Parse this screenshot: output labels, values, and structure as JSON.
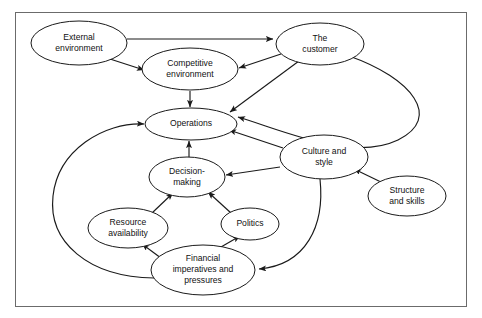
{
  "figure": {
    "type": "node-link-diagram",
    "frame": {
      "visible": true,
      "border_color": "#6b6b6b",
      "background": "#ffffff"
    },
    "stroke_color": "#1a1a1a",
    "node_fill": "#ffffff"
  },
  "nodes": [
    {
      "id": "external-environment",
      "label_lines": [
        "External",
        "environment"
      ],
      "label": "External environment",
      "cx": 79,
      "cy": 43,
      "rx": 48,
      "ry": 22
    },
    {
      "id": "competitive-environment",
      "label_lines": [
        "Competitive",
        "environment"
      ],
      "label": "Competitive environment",
      "cx": 190,
      "cy": 69,
      "rx": 48,
      "ry": 21
    },
    {
      "id": "the-customer",
      "label_lines": [
        "The",
        "customer"
      ],
      "label": "The customer",
      "cx": 320,
      "cy": 44,
      "rx": 44,
      "ry": 21
    },
    {
      "id": "operations",
      "label_lines": [
        "Operations"
      ],
      "label": "Operations",
      "cx": 191,
      "cy": 124,
      "rx": 46,
      "ry": 16
    },
    {
      "id": "decision-making",
      "label_lines": [
        "Decision-",
        "making"
      ],
      "label": "Decision-making",
      "cx": 187,
      "cy": 177,
      "rx": 38,
      "ry": 20
    },
    {
      "id": "culture-and-style",
      "label_lines": [
        "Culture and",
        "style"
      ],
      "label": "Culture and style",
      "cx": 324,
      "cy": 157,
      "rx": 44,
      "ry": 22
    },
    {
      "id": "structure-and-skills",
      "label_lines": [
        "Structure",
        "and skills"
      ],
      "label": "Structure and skills",
      "cx": 407,
      "cy": 196,
      "rx": 39,
      "ry": 20
    },
    {
      "id": "resource-availability",
      "label_lines": [
        "Resource",
        "availability"
      ],
      "label": "Resource availability",
      "cx": 128,
      "cy": 228,
      "rx": 40,
      "ry": 20
    },
    {
      "id": "politics",
      "label_lines": [
        "Politics"
      ],
      "label": "Politics",
      "cx": 250,
      "cy": 224,
      "rx": 29,
      "ry": 16
    },
    {
      "id": "financial-imperatives",
      "label_lines": [
        "Financial",
        "imperatives and",
        "pressures"
      ],
      "label": "Financial imperatives and pressures",
      "cx": 203,
      "cy": 270,
      "rx": 52,
      "ry": 25
    }
  ],
  "edges": [
    {
      "id": "external-to-customer",
      "from": "external-environment",
      "to": "the-customer",
      "style": "straight",
      "d": "M 127 39 L 273 39",
      "arrow": true
    },
    {
      "id": "external-to-competitive",
      "from": "external-environment",
      "to": "competitive-environment",
      "style": "straight",
      "d": "M 110 59 L 144 70",
      "arrow": true
    },
    {
      "id": "customer-to-competitive",
      "from": "the-customer",
      "to": "competitive-environment",
      "style": "straight",
      "d": "M 281 54 L 239 68",
      "arrow": true
    },
    {
      "id": "competitive-to-operations",
      "from": "competitive-environment",
      "to": "operations",
      "style": "straight",
      "d": "M 190 91 L 190 107",
      "arrow": true
    },
    {
      "id": "customer-to-operations",
      "from": "the-customer",
      "to": "operations",
      "style": "straight",
      "d": "M 299 61 L 230 112",
      "arrow": true
    },
    {
      "id": "culture-to-operations",
      "from": "culture-and-style",
      "to": "operations",
      "style": "straight",
      "d": "M 283 148 L 229 130",
      "arrow": true
    },
    {
      "id": "decision-to-operations",
      "from": "decision-making",
      "to": "operations",
      "style": "straight",
      "d": "M 189 157 L 189 141",
      "arrow": true
    },
    {
      "id": "customer-arc-to-operations",
      "from": "the-customer",
      "to": "operations",
      "style": "arc-right",
      "d": "M 349 56 C 412 78 443 118 398 140 C 352 162 285 131 238 117",
      "arrow": true
    },
    {
      "id": "resource-to-decision",
      "from": "resource-availability",
      "to": "decision-making",
      "style": "straight",
      "d": "M 152 213 L 173 193",
      "arrow": true
    },
    {
      "id": "politics-to-decision",
      "from": "politics",
      "to": "decision-making",
      "style": "straight",
      "d": "M 231 213 L 208 192",
      "arrow": true
    },
    {
      "id": "culture-to-decision",
      "from": "culture-and-style",
      "to": "decision-making",
      "style": "straight",
      "d": "M 280 167 L 226 175",
      "arrow": true
    },
    {
      "id": "financial-to-resource",
      "from": "financial-imperatives",
      "to": "resource-availability",
      "style": "straight",
      "d": "M 165 261 L 142 244",
      "arrow": true
    },
    {
      "id": "financial-to-politics",
      "from": "financial-imperatives",
      "to": "politics",
      "style": "straight",
      "d": "M 221 247 L 240 236",
      "arrow": true
    },
    {
      "id": "structure-to-culture",
      "from": "structure-and-skills",
      "to": "culture-and-style",
      "style": "straight",
      "d": "M 383 183 L 354 169",
      "arrow": true
    },
    {
      "id": "culture-to-financial",
      "from": "culture-and-style",
      "to": "financial-imperatives",
      "style": "arc-down",
      "d": "M 320 179 C 325 226 306 265 259 269",
      "arrow": true
    },
    {
      "id": "financial-arc-to-operations",
      "from": "financial-imperatives",
      "to": "operations",
      "style": "arc-left",
      "d": "M 154 278 C 88 277 48 242 53 196 C 58 150 104 122 144 124",
      "arrow": true
    }
  ]
}
